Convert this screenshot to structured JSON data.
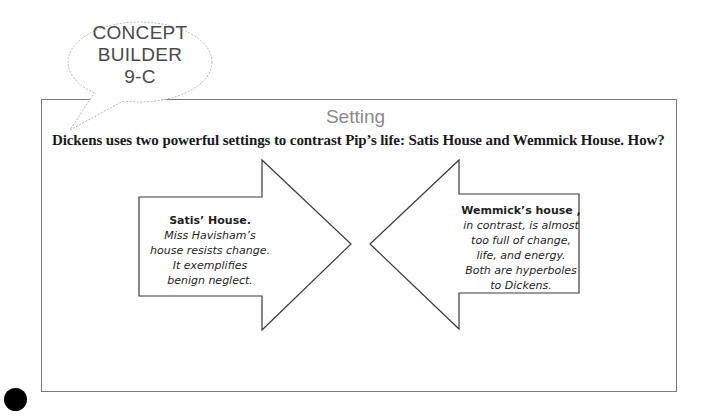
{
  "badge": {
    "lines": [
      "CONCEPT",
      "BUILDER",
      "9-C"
    ]
  },
  "section": {
    "title": "Setting",
    "question": "Dickens uses two powerful settings to contrast Pip’s life: Satis House and Wemmick House. How?"
  },
  "cards": {
    "left": {
      "heading": "Satis’ House.",
      "lines": [
        "Miss Havisham’s",
        "house resists change.",
        "It exemplifies",
        "benign neglect."
      ]
    },
    "right": {
      "heading": "Wemmick’s house ,",
      "lines": [
        "in contrast, is almost",
        "too full of change,",
        "life, and energy.",
        "Both are hyperboles",
        "to Dickens."
      ]
    }
  },
  "colors": {
    "frame_border": "#7a7a7a",
    "arrow_stroke": "#3a3a3a",
    "bubble_stroke": "#b8b8b8",
    "title": "#8a8a8a"
  }
}
